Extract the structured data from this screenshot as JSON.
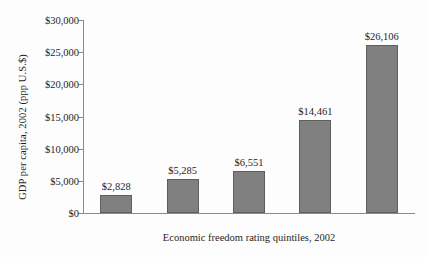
{
  "chart_data": {
    "type": "bar",
    "title": "",
    "categories": [
      "Bottom",
      "Fourth",
      "Third",
      "Second",
      "Top"
    ],
    "values": [
      2828,
      5285,
      6551,
      14461,
      26106
    ],
    "value_labels": [
      "$2,828",
      "$5,285",
      "$6,551",
      "$14,461",
      "$26,106"
    ],
    "xlabel": "Economic freedom rating quintiles, 2002",
    "ylabel": "GDP per capita, 2002 (ppp U.S.$)",
    "ylim": [
      0,
      30000
    ],
    "ytick_values": [
      0,
      5000,
      10000,
      15000,
      20000,
      25000,
      30000
    ],
    "ytick_labels": [
      "$0",
      "$5,000",
      "$10,000",
      "$15,000",
      "$20,000",
      "$25,000",
      "$30,000"
    ],
    "grid": false,
    "legend": false,
    "bar_color": "#808080",
    "bar_border_color": "#5e5e5e",
    "axis_color": "#8b8b8b",
    "background": "#fdfdfd"
  }
}
